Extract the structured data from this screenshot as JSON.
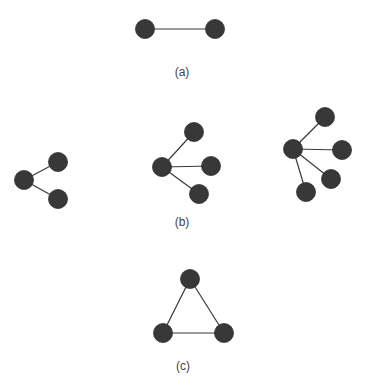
{
  "colors": {
    "node": "#383838",
    "edge": "#3a3a3a",
    "label": "#444444",
    "background": "#ffffff"
  },
  "figures": [
    {
      "id": "a",
      "label": "(a)",
      "description": "Two nodes connected by a single edge",
      "graphs": [
        {
          "name": "pair",
          "nodes": [
            "n1",
            "n2"
          ],
          "edges": [
            [
              "n1",
              "n2"
            ]
          ]
        }
      ]
    },
    {
      "id": "b",
      "label": "(b)",
      "description": "Star graphs with a hub and 2, 3 and 4 leaves",
      "graphs": [
        {
          "name": "star-2",
          "nodes": [
            "hub",
            "l1",
            "l2"
          ],
          "edges": [
            [
              "hub",
              "l1"
            ],
            [
              "hub",
              "l2"
            ]
          ]
        },
        {
          "name": "star-3",
          "nodes": [
            "hub",
            "l1",
            "l2",
            "l3"
          ],
          "edges": [
            [
              "hub",
              "l1"
            ],
            [
              "hub",
              "l2"
            ],
            [
              "hub",
              "l3"
            ]
          ]
        },
        {
          "name": "star-4",
          "nodes": [
            "hub",
            "l1",
            "l2",
            "l3",
            "l4"
          ],
          "edges": [
            [
              "hub",
              "l1"
            ],
            [
              "hub",
              "l2"
            ],
            [
              "hub",
              "l3"
            ],
            [
              "hub",
              "l4"
            ]
          ]
        }
      ]
    },
    {
      "id": "c",
      "label": "(c)",
      "description": "Triangle of three mutually connected nodes",
      "graphs": [
        {
          "name": "triangle",
          "nodes": [
            "t",
            "bl",
            "br"
          ],
          "edges": [
            [
              "t",
              "bl"
            ],
            [
              "t",
              "br"
            ],
            [
              "bl",
              "br"
            ]
          ]
        }
      ]
    }
  ]
}
